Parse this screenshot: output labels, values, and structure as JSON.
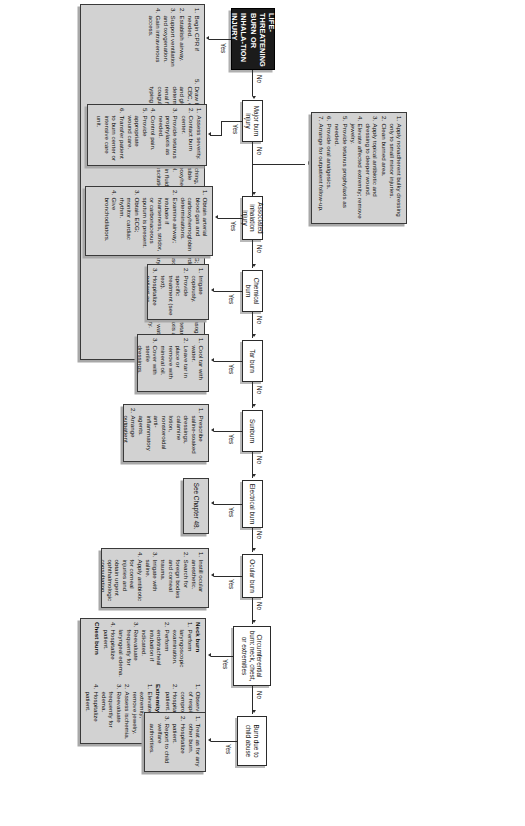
{
  "title": {
    "text": "LIFE-THREATENING BURN OR INHALA-TION INJURY"
  },
  "edge_labels": {
    "yes": "Yes",
    "no": "No"
  },
  "decisions": [
    {
      "id": "major_burn",
      "label": "Major burn injury"
    },
    {
      "id": "inhalation",
      "label": "Associated inhalation injury"
    },
    {
      "id": "chemical",
      "label": "Chemical burn"
    },
    {
      "id": "tar",
      "label": "Tar burn"
    },
    {
      "id": "sunburn",
      "label": "Sunburn"
    },
    {
      "id": "electrical",
      "label": "Electrical burn"
    },
    {
      "id": "ocular",
      "label": "Ocular burn"
    },
    {
      "id": "circumferential",
      "label": "Circumferential burn: neck, chest, or extremities"
    },
    {
      "id": "child_abuse",
      "label": "Burn due to child abuse"
    }
  ],
  "actions": {
    "life_threatening": {
      "items": [
        "Begin CPR if needed.",
        "Establish airway.",
        "Support ventilation and oxygenation.",
        "Gain intravenous access.",
        "Draw blood for CBC, electrolyte and glucose determinations, renal function tests, coagulation tests, typing and cross matching, and possible carboxyhemoglobin level.",
        "Begin fluid resuscitation.",
        "Obtain ECG; monitor cardiac rhythm.",
        "Look for associated injuries.",
        "Insert urinary catheter.",
        "Insert nasogastric tube.",
        "Provide tetanus prophylaxis as needed.",
        "Remove watch and all jewelry."
      ]
    },
    "major_burn_yes": {
      "items": [
        "Assess severity.",
        "Contact burn center.",
        "Provide tetanus prophylaxis as needed.",
        "Control pain.",
        "Provide appropriate wound care.",
        "Transfer patient to burn center or intensive care unit."
      ]
    },
    "major_burn_no": {
      "items": [
        "Apply nonadherent bulky dressing only to small minor injuries.",
        "Clean burned area.",
        "Apply topical antibiotic and dressing to deeper wound.",
        "Elevate affected extremity; remove jewelry.",
        "Provide tetanus prophylaxis as needed.",
        "Provide oral analgesics.",
        "Arrange for outpatient follow-up."
      ]
    },
    "inhalation_yes": {
      "items": [
        "Obtain arterial blood gas and carboxyhemoglobin determinations.",
        "Examine airway; intubate if hoarseness, stridor, or carbonaceous sputum is present.",
        "Obtain ECG; monitor cardiac rhythm.",
        "Give bronchodilators."
      ]
    },
    "chemical_yes": {
      "items": [
        "Irrigate copiously.",
        "Provide specific treatment (see text).",
        "Hospitalize patient as needed."
      ]
    },
    "tar_yes": {
      "items": [
        "Cool tar with water.",
        "Leave tar in place or remove with mineral oil.",
        "Cover with sterile dressings.",
        "Hospitalize patient as needed."
      ]
    },
    "sunburn_yes": {
      "items": [
        "Prescribe saline-soaked dressings, calamine lotion, nonsteroidal anti-inflammatory agents.",
        "Arrange outpatient follow-up if admission is not necessary."
      ]
    },
    "electrical_yes": {
      "plain": "See Chapter 48."
    },
    "ocular_yes": {
      "items": [
        "Instill ocular anesthetic.",
        "Search for foreign bodies and corneal trauma.",
        "Irrigate with saline.",
        "Apply antibiotic for corneal injuries and obtain urgent ophthalmologic consultation.",
        "Patch the eye.",
        "Hospitalize patient."
      ]
    },
    "circumferential_yes": {
      "groups": [
        {
          "heading": "Neck burn",
          "items": [
            "Perform laryngoscopic examination.",
            "Perform endotracheal intubation if indicated.",
            "Reevaluate frequently for laryngeal edema.",
            "Hospitalize patient."
          ]
        },
        {
          "heading": "Chest burn",
          "items": [
            "Observe for signs of respiratory compromise.",
            "Hospitalize patient."
          ]
        },
        {
          "heading": "Extremity burn",
          "items": [
            "Elevate injured extremity; remove jewelry.",
            "Assess ischemia.",
            "Reevaluate frequently for edema.",
            "Hospitalize patient."
          ]
        }
      ]
    },
    "child_abuse_yes": {
      "items": [
        "Treat as for any other burn.",
        "Hospitalize patient.",
        "Report to child welfare authorities."
      ]
    }
  }
}
